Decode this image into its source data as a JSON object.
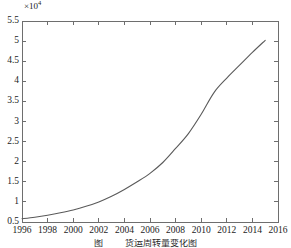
{
  "chart_data": {
    "type": "line",
    "title": "",
    "xlabel": "",
    "ylabel": "",
    "exponent_mantissa": "×10",
    "exponent_power": "4",
    "y_scale_factor": 10000,
    "xlim": [
      1996,
      2016
    ],
    "ylim": [
      0.5,
      5.5
    ],
    "grid": false,
    "legend": null,
    "xticks": [
      1996,
      1998,
      2000,
      2002,
      2004,
      2006,
      2008,
      2010,
      2012,
      2014,
      2016
    ],
    "xtick_labels": [
      "1996",
      "1998",
      "2000",
      "2002",
      "2004",
      "2006",
      "2008",
      "2010",
      "2012",
      "2014",
      "2016"
    ],
    "yticks": [
      0.5,
      1,
      1.5,
      2,
      2.5,
      3,
      3.5,
      4,
      4.5,
      5,
      5.5
    ],
    "ytick_labels": [
      "0.5",
      "1",
      "1.5",
      "2",
      "2.5",
      "3",
      "3.5",
      "4",
      "4.5",
      "5",
      "5.5"
    ],
    "minor_xticks": [
      1997,
      1999,
      2001,
      2003,
      2005,
      2007,
      2009,
      2011,
      2013,
      2015
    ],
    "series": [
      {
        "name": "series-1",
        "color": "#5a5a5a",
        "line_width": 1,
        "x": [
          1996,
          1997,
          1998,
          1999,
          2000,
          2001,
          2002,
          2003,
          2004,
          2005,
          2006,
          2007,
          2008,
          2009,
          2010,
          2011,
          2012,
          2013,
          2014,
          2015
        ],
        "values": [
          0.58,
          0.62,
          0.67,
          0.73,
          0.8,
          0.89,
          1.0,
          1.14,
          1.31,
          1.5,
          1.71,
          1.98,
          2.33,
          2.7,
          3.18,
          3.72,
          4.08,
          4.4,
          4.72,
          5.02
        ]
      }
    ],
    "axis_color": "#6e6e6e",
    "background_color": "#ffffff"
  },
  "figure": {
    "caption_left": "图",
    "caption_right": "货运周转量变化图"
  }
}
